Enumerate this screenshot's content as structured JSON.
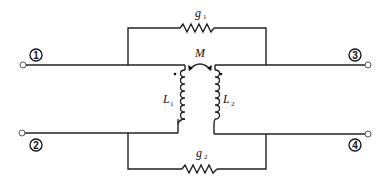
{
  "diagram": {
    "type": "two-port coupled-inductor network",
    "terminals": [
      {
        "id": "1",
        "label": "1"
      },
      {
        "id": "2",
        "label": "2"
      },
      {
        "id": "3",
        "label": "3"
      },
      {
        "id": "4",
        "label": "4"
      }
    ],
    "components": {
      "g1": {
        "symbol": "g",
        "subscript": "1"
      },
      "g2": {
        "symbol": "g",
        "subscript": "2"
      },
      "L1": {
        "symbol": "L",
        "subscript": "1"
      },
      "L2": {
        "symbol": "L",
        "subscript": "2"
      },
      "M": {
        "symbol": "M"
      }
    },
    "colors": {
      "line": "#222222",
      "background": "#ffffff"
    }
  }
}
